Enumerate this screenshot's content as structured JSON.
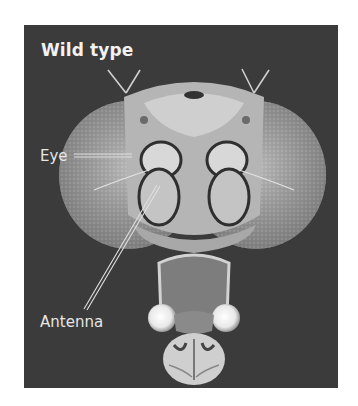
{
  "figure": {
    "title": "Wild type",
    "labels": {
      "eye": "Eye",
      "antenna": "Antenna"
    },
    "background_color": "#3b3b3b"
  }
}
